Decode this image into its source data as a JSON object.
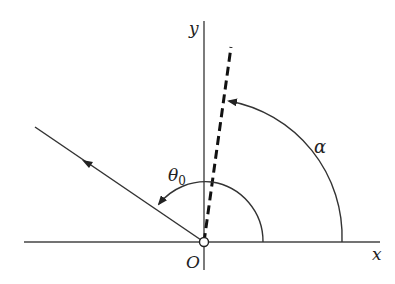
{
  "diagram": {
    "type": "angle-diagram",
    "axes": {
      "x_label": "x",
      "y_label": "y",
      "origin_label": "O"
    },
    "angles": [
      {
        "name": "alpha",
        "label": "α",
        "from": "positive x-axis",
        "to": "dashed line"
      },
      {
        "name": "theta0",
        "label": "θ",
        "subscript": "0",
        "from": "dashed line",
        "to": "incident line"
      }
    ],
    "lines": [
      {
        "name": "dashed-line",
        "style": "dashed",
        "description": "line through origin at angle α from x-axis"
      },
      {
        "name": "incident-line",
        "style": "solid",
        "description": "ray from origin into second quadrant with arrow"
      }
    ],
    "colors": {
      "stroke": "#222222",
      "background": "#ffffff"
    }
  }
}
